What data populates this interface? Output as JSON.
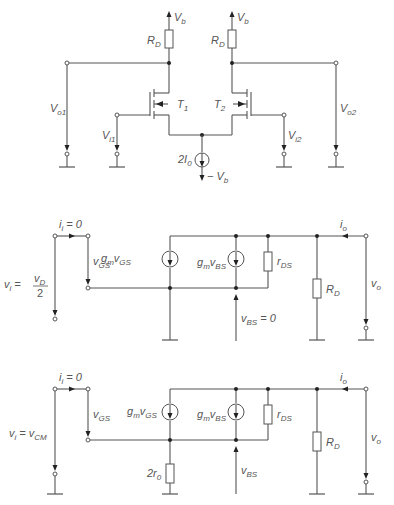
{
  "diagram_title": "Differential amplifier and small-signal equivalent circuits",
  "top_circuit": {
    "supply_left": {
      "main": "V",
      "sub": "b"
    },
    "supply_right": {
      "main": "V",
      "sub": "b"
    },
    "rd_left": {
      "main": "R",
      "sub": "D"
    },
    "rd_right": {
      "main": "R",
      "sub": "D"
    },
    "t1": {
      "main": "T",
      "sub": "1"
    },
    "t2": {
      "main": "T",
      "sub": "2"
    },
    "vo1": {
      "main": "V",
      "sub": "o1"
    },
    "vo2": {
      "main": "V",
      "sub": "o2"
    },
    "vi1": {
      "main": "V",
      "sub": "i1"
    },
    "vi2": {
      "main": "V",
      "sub": "i2"
    },
    "current_source": {
      "prefix": "2I",
      "sub": "0"
    },
    "neg_supply": {
      "prefix": "− V",
      "sub": "b"
    }
  },
  "middle_circuit": {
    "ii": {
      "main": "i",
      "sub": "i",
      "suffix": " = 0"
    },
    "vgs": {
      "main": "v",
      "sub": "GS"
    },
    "vi_label": {
      "main": "v",
      "sub": "i",
      "eq": " = "
    },
    "vi_frac_num": {
      "main": "v",
      "sub": "D"
    },
    "vi_frac_den": "2",
    "gm_vgs": {
      "g": "g",
      "gsub": "m",
      "v": "v",
      "vsub": "GS"
    },
    "gm_vbs": {
      "g": "g",
      "gsub": "m",
      "v": "v",
      "vsub": "BS"
    },
    "rds": {
      "main": "r",
      "sub": "DS"
    },
    "rd": {
      "main": "R",
      "sub": "D"
    },
    "io": {
      "main": "i",
      "sub": "o"
    },
    "vo": {
      "main": "v",
      "sub": "o"
    },
    "vbs": {
      "main": "v",
      "sub": "BS",
      "suffix": " = 0"
    }
  },
  "bottom_circuit": {
    "ii": {
      "main": "i",
      "sub": "i",
      "suffix": " = 0"
    },
    "vgs": {
      "main": "v",
      "sub": "GS"
    },
    "vi": {
      "main": "v",
      "sub": "i",
      "eq": " = v",
      "sub2": "CM"
    },
    "gm_vgs": {
      "g": "g",
      "gsub": "m",
      "v": "v",
      "vsub": "GS"
    },
    "gm_vbs": {
      "g": "g",
      "gsub": "m",
      "v": "v",
      "vsub": "BS"
    },
    "rds": {
      "main": "r",
      "sub": "DS"
    },
    "rd": {
      "main": "R",
      "sub": "D"
    },
    "r0": {
      "prefix": "2r",
      "sub": "0"
    },
    "io": {
      "main": "i",
      "sub": "o"
    },
    "vo": {
      "main": "v",
      "sub": "o"
    },
    "vbs": {
      "main": "v",
      "sub": "BS"
    }
  }
}
